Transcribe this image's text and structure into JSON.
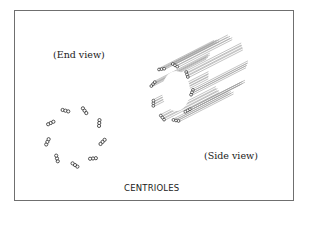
{
  "figure": {
    "title": "CENTRIOLES",
    "end_view_label": "(End view)",
    "side_view_label": "(Side view)",
    "stroke_color": "#2b2b2b",
    "tube_line_color": "#9a9a9a",
    "frame_color": "#6f6f6f"
  },
  "structure": {
    "triplet_count": 9,
    "tubules_per_triplet": 3
  }
}
